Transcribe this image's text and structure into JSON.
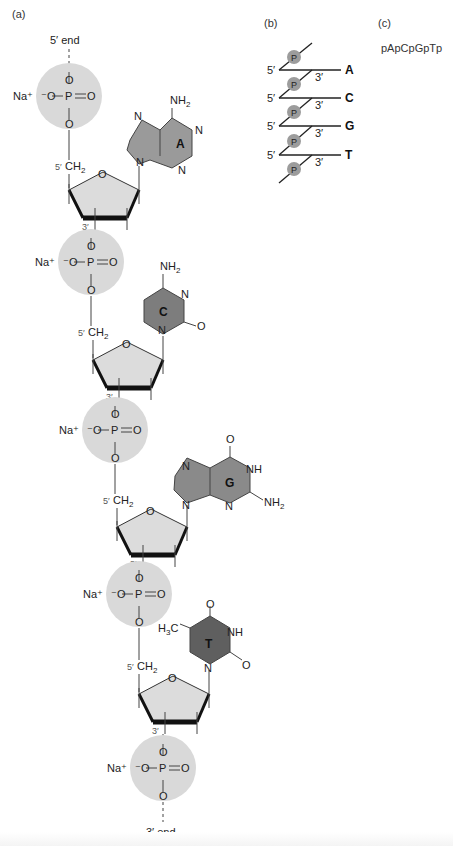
{
  "panels": {
    "a": {
      "label": "(a)",
      "five_prime_end": "5′ end",
      "three_prime_end": "3′ end",
      "counterion": "Na⁺",
      "phosphate": {
        "o_minus": "⁻O",
        "p": "P",
        "o": "O"
      },
      "sugar": {
        "ring_o": "O",
        "c5_label": "5′",
        "ch2": "CH",
        "sub2": "2",
        "c3_label": "3′"
      },
      "nucleotides": [
        {
          "base": "A",
          "name": "adenine",
          "substituents": [
            "NH2",
            "N",
            "N",
            "N",
            "N"
          ]
        },
        {
          "base": "C",
          "name": "cytosine",
          "substituents": [
            "NH2",
            "N",
            "O",
            "N"
          ]
        },
        {
          "base": "G",
          "name": "guanine",
          "substituents": [
            "O",
            "NH",
            "NH2",
            "N",
            "N",
            "N"
          ]
        },
        {
          "base": "T",
          "name": "thymine",
          "substituents": [
            "H3C",
            "O",
            "NH",
            "O",
            "N"
          ]
        }
      ]
    },
    "b": {
      "label": "(b)",
      "phosphate_glyph": "P",
      "five_prime": "5′",
      "three_prime": "3′",
      "bases": [
        "A",
        "C",
        "G",
        "T"
      ]
    },
    "c": {
      "label": "(c)",
      "sequence": "pApCpGpTp"
    }
  },
  "colors": {
    "phosphate_circle": "#d9d9d9",
    "sugar_fill": "#dcdcdc",
    "base_A": "#9a9a9a",
    "base_C": "#7d7d7d",
    "base_G": "#8a8a8a",
    "base_T": "#5f5f5f",
    "p_ball": "#9c9c9c",
    "line": "#222222"
  }
}
